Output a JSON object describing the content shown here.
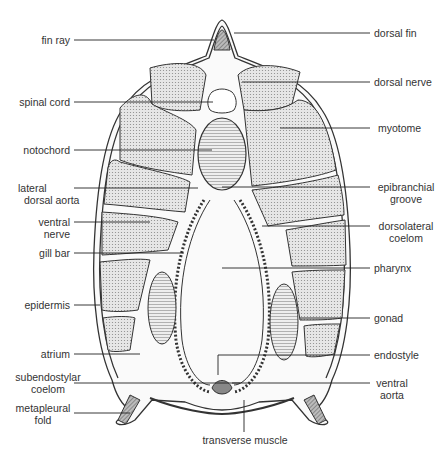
{
  "labels_left": [
    {
      "id": "fin-ray",
      "text": "fin ray"
    },
    {
      "id": "spinal-cord",
      "text": "spinal cord"
    },
    {
      "id": "notochord",
      "text": "notochord"
    },
    {
      "id": "lateral-dorsal-aorta",
      "l1": "lateral",
      "l2": "dorsal aorta"
    },
    {
      "id": "ventral-nerve",
      "l1": "ventral",
      "l2": "nerve"
    },
    {
      "id": "gill-bar",
      "text": "gill bar"
    },
    {
      "id": "epidermis",
      "text": "epidermis"
    },
    {
      "id": "atrium",
      "text": "atrium"
    },
    {
      "id": "subendostylar-coelom",
      "l1": "subendostylar",
      "l2": "coelom"
    },
    {
      "id": "metapleural-fold",
      "l1": "metapleural",
      "l2": "fold"
    }
  ],
  "labels_right": [
    {
      "id": "dorsal-fin",
      "text": "dorsal fin"
    },
    {
      "id": "dorsal-nerve",
      "text": "dorsal nerve"
    },
    {
      "id": "myotome",
      "text": "myotome"
    },
    {
      "id": "epibranchial-groove",
      "l1": "epibranchial",
      "l2": "groove"
    },
    {
      "id": "dorsolateral-coelom",
      "l1": "dorsolateral",
      "l2": "coelom"
    },
    {
      "id": "pharynx",
      "text": "pharynx"
    },
    {
      "id": "gonad",
      "text": "gonad"
    },
    {
      "id": "endostyle",
      "text": "endostyle"
    },
    {
      "id": "ventral-aorta",
      "l1": "ventral",
      "l2": "aorta"
    }
  ],
  "label_bottom": {
    "id": "transverse-muscle",
    "text": "transverse muscle"
  },
  "colors": {
    "line": "#333333",
    "fill": "#d8d8d8",
    "dark": "#777777"
  }
}
